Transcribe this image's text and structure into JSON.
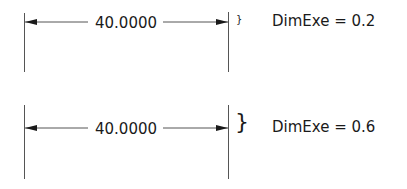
{
  "examples": [
    {
      "dimension_value": "40.0000",
      "brace_glyph": "}",
      "label": "DimExe = 0.2",
      "dimexe": 0.2
    },
    {
      "dimension_value": "40.0000",
      "brace_glyph": "}",
      "label": "DimExe = 0.6",
      "dimexe": 0.6
    }
  ],
  "colors": {
    "line": "#555555",
    "arrow": "#1a1a1a",
    "text": "#1a1a1a",
    "background": "#ffffff"
  }
}
